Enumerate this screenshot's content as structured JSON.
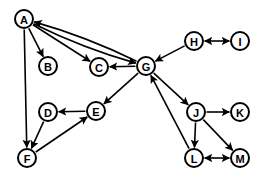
{
  "diagram": {
    "type": "node-link-directed-graph",
    "width": 271,
    "height": 184,
    "background_color": "#ffffff",
    "node_fill_color": "#ffffff",
    "node_stroke_color": "#000000",
    "edge_color": "#000000",
    "node_radius": 9,
    "nodes": [
      {
        "id": "A",
        "label": "A",
        "x": 24,
        "y": 19
      },
      {
        "id": "B",
        "label": "B",
        "x": 48,
        "y": 66
      },
      {
        "id": "C",
        "label": "C",
        "x": 99,
        "y": 67
      },
      {
        "id": "D",
        "label": "D",
        "x": 48,
        "y": 112
      },
      {
        "id": "E",
        "label": "E",
        "x": 96,
        "y": 111
      },
      {
        "id": "F",
        "label": "F",
        "x": 27,
        "y": 158
      },
      {
        "id": "G",
        "label": "G",
        "x": 146,
        "y": 66
      },
      {
        "id": "H",
        "label": "H",
        "x": 194,
        "y": 41
      },
      {
        "id": "I",
        "label": "I",
        "x": 240,
        "y": 41
      },
      {
        "id": "J",
        "label": "J",
        "x": 196,
        "y": 112
      },
      {
        "id": "K",
        "label": "K",
        "x": 240,
        "y": 112
      },
      {
        "id": "L",
        "label": "L",
        "x": 194,
        "y": 158
      },
      {
        "id": "M",
        "label": "M",
        "x": 240,
        "y": 158
      }
    ],
    "edges": [
      {
        "from": "A",
        "to": "B",
        "directed": "forward",
        "curve": 0
      },
      {
        "from": "A",
        "to": "C",
        "directed": "forward",
        "curve": 0
      },
      {
        "from": "A",
        "to": "G",
        "directed": "forward",
        "curve": 6
      },
      {
        "from": "G",
        "to": "A",
        "directed": "forward",
        "curve": 6
      },
      {
        "from": "A",
        "to": "F",
        "directed": "forward",
        "curve": 0
      },
      {
        "from": "G",
        "to": "C",
        "directed": "forward",
        "curve": 0
      },
      {
        "from": "G",
        "to": "E",
        "directed": "forward",
        "curve": 0
      },
      {
        "from": "G",
        "to": "J",
        "directed": "forward",
        "curve": 0
      },
      {
        "from": "H",
        "to": "G",
        "directed": "forward",
        "curve": 0
      },
      {
        "from": "H",
        "to": "I",
        "directed": "both",
        "curve": 0
      },
      {
        "from": "E",
        "to": "D",
        "directed": "forward",
        "curve": 0
      },
      {
        "from": "D",
        "to": "F",
        "directed": "forward",
        "curve": 0
      },
      {
        "from": "F",
        "to": "E",
        "directed": "forward",
        "curve": 0
      },
      {
        "from": "J",
        "to": "K",
        "directed": "forward",
        "curve": 0
      },
      {
        "from": "J",
        "to": "L",
        "directed": "forward",
        "curve": 0
      },
      {
        "from": "J",
        "to": "M",
        "directed": "forward",
        "curve": 0
      },
      {
        "from": "L",
        "to": "G",
        "directed": "forward",
        "curve": 0
      },
      {
        "from": "L",
        "to": "M",
        "directed": "both",
        "curve": 0
      }
    ]
  }
}
